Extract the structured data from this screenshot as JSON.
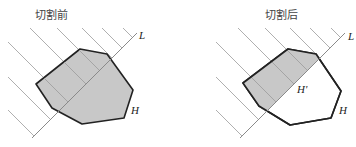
{
  "panels": [
    {
      "title": "切割前",
      "line_label": "L",
      "polygon_label": "H",
      "polygon_fill": "#c8c8c8"
    },
    {
      "title": "切割后",
      "line_label": "L",
      "polygon_label": "H",
      "subpolygon_label": "H'",
      "shaded_fill": "#c8c8c8",
      "remaining_fill": "#ffffff"
    }
  ]
}
